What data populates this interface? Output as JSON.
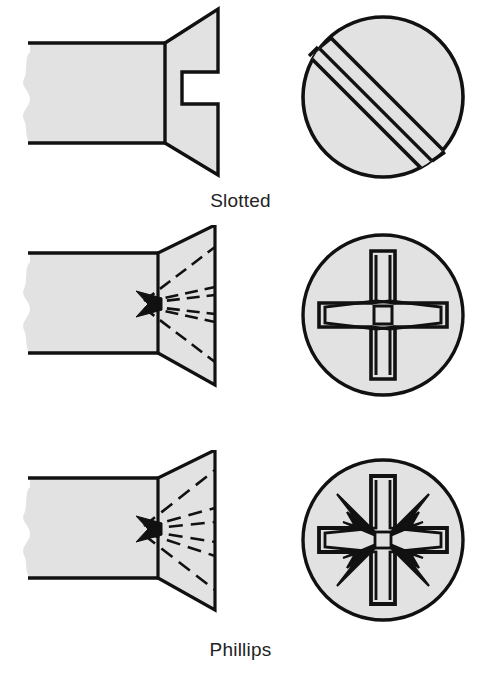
{
  "figure": {
    "background_color": "#ffffff",
    "fill_color": "#e2e2e2",
    "line_color": "#111111"
  },
  "drives": [
    {
      "id": "slotted",
      "label": "Slotted",
      "trademark": "",
      "side_view_name": "slotted-screw-side-section",
      "top_view_name": "slotted-screw-head-top",
      "recess_description": "single straight slot across the head",
      "head_style": "countersunk flat head",
      "top_view": {
        "circle_center_x": 383,
        "circle_center_y": 115,
        "circle_radius": 82,
        "slot_angle_deg": 45,
        "slot_width": 26
      }
    },
    {
      "id": "phillips",
      "label": "Phillips",
      "trademark": "",
      "side_view_name": "phillips-screw-side-section",
      "top_view_name": "phillips-screw-head-top",
      "recess_description": "cruciform recess with tapered flutes",
      "head_style": "countersunk flat head",
      "top_view": {
        "circle_center_x": 383,
        "circle_center_y": 90,
        "circle_radius": 82,
        "cross_arm_length": 62,
        "cross_arm_width": 24
      }
    },
    {
      "id": "pozidriv",
      "label": "Pozidriv",
      "trademark": "®",
      "side_view_name": "pozidriv-screw-side-section",
      "top_view_name": "pozidriv-screw-head-top",
      "recess_description": "cruciform recess with additional diagonal ribs",
      "head_style": "countersunk flat head",
      "top_view": {
        "circle_center_x": 383,
        "circle_center_y": 90,
        "circle_radius": 82,
        "cross_arm_length": 62,
        "cross_arm_width": 24,
        "rib_count": 4
      }
    }
  ]
}
